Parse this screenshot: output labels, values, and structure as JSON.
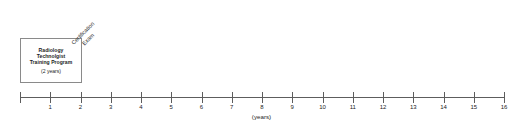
{
  "diagram": {
    "kind": "timeline",
    "background_color": "#ffffff",
    "line_color": "#5d5d5d",
    "box_border_color": "#8a8a8a",
    "text_color": "#1d1d1d"
  },
  "phase_box": {
    "lines": [
      "Radiology",
      "Technolgist",
      "Training Program"
    ],
    "duration": "(2 years)",
    "start_year": 0,
    "end_year": 2
  },
  "event": {
    "line1": "Certification",
    "line2": "Exam",
    "at_year": 2,
    "rotation_degrees": -45
  },
  "axis": {
    "caption": "(years)",
    "min": 0,
    "max": 16,
    "tick_values": [
      0,
      1,
      2,
      3,
      4,
      5,
      6,
      7,
      8,
      9,
      10,
      11,
      12,
      13,
      14,
      15,
      16
    ],
    "tick_labels": [
      "",
      "1",
      "2",
      "3",
      "4",
      "5",
      "6",
      "7",
      "8",
      "9",
      "10",
      "11",
      "12",
      "13",
      "14",
      "15",
      "16"
    ],
    "pixel_origin_x": 20,
    "pixel_per_year": 30.25,
    "pixel_y": 97
  },
  "chart_data": {
    "type": "table",
    "title": "",
    "xlabel": "(years)",
    "ylabel": "",
    "xlim": [
      0,
      16
    ],
    "grid": false,
    "categories": [
      "Radiology Technolgist Training Program",
      "Certification Exam"
    ],
    "values": [
      2,
      2
    ],
    "series": [
      {
        "name": "Radiology Technolgist Training Program",
        "kind": "span",
        "start": 0,
        "end": 2,
        "duration": 2,
        "label": "(2 years)"
      },
      {
        "name": "Certification Exam",
        "kind": "milestone",
        "start": 2,
        "end": 2,
        "duration": 0,
        "label": "Certification Exam"
      }
    ]
  }
}
